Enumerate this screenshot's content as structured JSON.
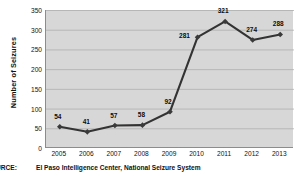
{
  "chart_data": {
    "type": "line",
    "title": "",
    "subtitle": "",
    "xlabel": "",
    "ylabel": "Number of Seizures",
    "categories": [
      "2005",
      "2006",
      "2007",
      "2008",
      "2009",
      "2010",
      "2011",
      "2012",
      "2013"
    ],
    "values": [
      54,
      41,
      57,
      58,
      92,
      281,
      321,
      274,
      288
    ],
    "point_labels": [
      "54",
      "41",
      "57",
      "58",
      "92",
      "281",
      "321",
      "274",
      "288"
    ],
    "series": [
      {
        "name": "Number of Seizures",
        "values": [
          54,
          41,
          57,
          58,
          92,
          281,
          321,
          274,
          288
        ]
      }
    ],
    "ylim": [
      0,
      350
    ],
    "ytick_values": [
      0,
      50,
      100,
      150,
      200,
      250,
      300,
      350
    ],
    "ytick_labels": [
      "0",
      "50",
      "100",
      "150",
      "200",
      "250",
      "300",
      "350"
    ],
    "grid": "horizontal",
    "legend": "none",
    "marker": "diamond",
    "colors": {
      "line": "#333333",
      "marker": "#3a3a3a",
      "plot_background": "#d7d7d7",
      "gridline": "#a8a8a8",
      "axis": "#8c8c8c",
      "text": "#111111",
      "figure_background": "#ffffff"
    }
  },
  "footer": {
    "source_label": "URCE:",
    "source_text": "El Paso Intelligence Center, National Seizure System"
  }
}
